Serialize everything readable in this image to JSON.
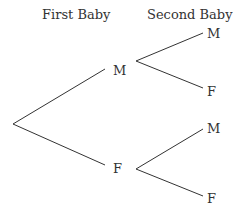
{
  "headers": {
    "first": "First Baby",
    "second": "Second Baby"
  },
  "nodes": {
    "first_m": "M",
    "first_f": "F",
    "m_then_m": "M",
    "m_then_f": "F",
    "f_then_m": "M",
    "f_then_f": "F"
  },
  "line_color": "#333333"
}
